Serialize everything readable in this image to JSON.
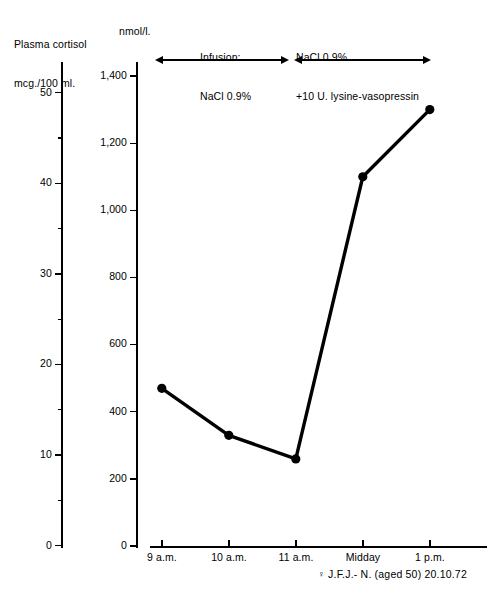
{
  "chart_data": {
    "type": "line",
    "title": "",
    "subtitle": "",
    "ylabel": "Plasma cortisol\nmcg./100 ml.",
    "ylabel_secondary": "nmol/l.",
    "xlabel": "",
    "categories": [
      "9 a.m.",
      "10 a.m.",
      "11 a.m.",
      "Midday",
      "1 p.m."
    ],
    "x": [
      9,
      10,
      11,
      12,
      13
    ],
    "values": [
      470,
      330,
      260,
      1100,
      1300
    ],
    "values_secondary_unit": "nmol/l.",
    "values_primary_unit": "mcg./100 ml.",
    "values_primary": [
      17.0,
      12.0,
      9.4,
      39.8,
      47.0
    ],
    "series": [
      {
        "name": "Plasma cortisol",
        "values": [
          470,
          330,
          260,
          1100,
          1300
        ],
        "marker": "filled-circle",
        "color": "#000000"
      }
    ],
    "ylim": [
      0,
      1400
    ],
    "ylim_secondary": [
      0,
      50
    ],
    "yticks": [
      0,
      200,
      400,
      600,
      800,
      1000,
      1200,
      1400
    ],
    "ytick_labels": [
      "0",
      "200",
      "400",
      "600",
      "800",
      "1,000",
      "1,200",
      "1,400"
    ],
    "yticks_secondary": [
      0,
      10,
      20,
      30,
      40,
      50
    ],
    "ytick_labels_secondary": [
      "0",
      "10",
      "20",
      "30",
      "40",
      "50"
    ],
    "yticks_secondary_minor": [
      5,
      15,
      25,
      35,
      45
    ],
    "grid": false,
    "legend": "none",
    "annotations": [
      {
        "label": "Infusion:\nNaCl 0.9%",
        "label_line1": "Infusion:",
        "label_line2": "NaCl 0.9%",
        "span": [
          "9 a.m.",
          "11 a.m."
        ],
        "style": "double-headed-arrow"
      },
      {
        "label": "NaCl 0.9%\n+10 U. lysine-vasopressin",
        "label_line1": "NaCl 0.9%",
        "label_line2": "+10 U. lysine-vasopressin",
        "span": [
          "11 a.m.",
          "1 p.m."
        ],
        "style": "double-headed-arrow"
      }
    ],
    "caption": "J.F.J.- N. (aged 50) 20.10.72",
    "caption_sex_symbol": "♀"
  },
  "axes": {
    "left": {
      "title_line1": "Plasma cortisol",
      "title_line2": "mcg./100 ml.",
      "ticks": [
        {
          "label": "50",
          "value": 50
        },
        {
          "label": "40",
          "value": 40
        },
        {
          "label": "30",
          "value": 30
        },
        {
          "label": "20",
          "value": 20
        },
        {
          "label": "10",
          "value": 10
        },
        {
          "label": "0",
          "value": 0
        }
      ]
    },
    "right": {
      "title": "nmol/l.",
      "ticks": [
        {
          "label": "1,400",
          "value": 1400
        },
        {
          "label": "1,200",
          "value": 1200
        },
        {
          "label": "1,000",
          "value": 1000
        },
        {
          "label": "800",
          "value": 800
        },
        {
          "label": "600",
          "value": 600
        },
        {
          "label": "400",
          "value": 400
        },
        {
          "label": "200",
          "value": 200
        },
        {
          "label": "0",
          "value": 0
        }
      ]
    },
    "bottom": {
      "ticks": [
        {
          "label": "9 a.m."
        },
        {
          "label": "10 a.m."
        },
        {
          "label": "11 a.m."
        },
        {
          "label": "Midday"
        },
        {
          "label": "1 p.m."
        }
      ]
    }
  },
  "colors": {
    "ink": "#000000",
    "background": "#ffffff"
  }
}
